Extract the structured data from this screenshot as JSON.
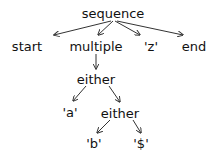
{
  "diagram": {
    "type": "tree",
    "line_color": "#333333",
    "text_color": "#111111",
    "nodes": [
      {
        "id": "sequence",
        "label": "sequence",
        "x": 113,
        "y": 13
      },
      {
        "id": "start",
        "label": "start",
        "x": 27,
        "y": 46
      },
      {
        "id": "multiple",
        "label": "multiple",
        "x": 96,
        "y": 46
      },
      {
        "id": "z",
        "label": "'z'",
        "x": 151,
        "y": 46
      },
      {
        "id": "end",
        "label": "end",
        "x": 194,
        "y": 46
      },
      {
        "id": "either1",
        "label": "either",
        "x": 96,
        "y": 79
      },
      {
        "id": "a",
        "label": "'a'",
        "x": 70,
        "y": 112
      },
      {
        "id": "either2",
        "label": "either",
        "x": 120,
        "y": 113
      },
      {
        "id": "b",
        "label": "'b'",
        "x": 94,
        "y": 143
      },
      {
        "id": "dollar",
        "label": "'$'",
        "x": 141,
        "y": 143
      }
    ],
    "edges": [
      {
        "from": "sequence",
        "to": "start"
      },
      {
        "from": "sequence",
        "to": "multiple"
      },
      {
        "from": "sequence",
        "to": "z"
      },
      {
        "from": "sequence",
        "to": "end"
      },
      {
        "from": "multiple",
        "to": "either1"
      },
      {
        "from": "either1",
        "to": "a"
      },
      {
        "from": "either1",
        "to": "either2"
      },
      {
        "from": "either2",
        "to": "b"
      },
      {
        "from": "either2",
        "to": "dollar"
      }
    ]
  }
}
